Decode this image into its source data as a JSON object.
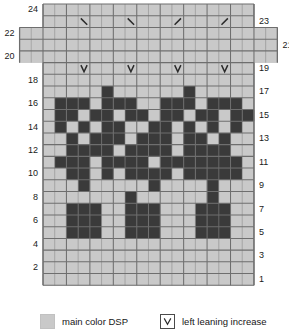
{
  "colors": {
    "main_color": "#c9c9c9",
    "contrast_color": "#3a3a3a",
    "grid_line": "#6e6e6e",
    "grid_line_minor": "#8a8a8a",
    "background": "#ffffff",
    "text": "#1a1a1a",
    "symbol": "#2b2b2b"
  },
  "chart_data": {
    "type": "heatmap",
    "title": "",
    "xlabel": "",
    "ylabel": "",
    "grid": true,
    "columns": 18,
    "rows": 24,
    "cell_px": 11.7,
    "legend_position": "bottom",
    "value_legend": {
      "0": "main color DSP",
      "1": "contrast color",
      "null": "no stitch"
    },
    "row_labels_left": [
      "24",
      "22",
      "20",
      "18",
      "16",
      "14",
      "12",
      "10",
      "8",
      "6",
      "4",
      "2"
    ],
    "row_labels_right": [
      "23",
      "21",
      "19",
      "17",
      "15",
      "13",
      "11",
      "9",
      "7",
      "5",
      "3",
      "1"
    ],
    "row_extension": {
      "note": "rows 20,21,22 extend 2 columns further at each side",
      "rows": [
        20,
        21,
        22
      ],
      "extra_left": 2,
      "extra_right": 2
    },
    "rows_data": [
      {
        "row": 24,
        "cells": [
          0,
          0,
          0,
          0,
          0,
          0,
          0,
          0,
          0,
          0,
          0,
          0,
          0,
          0,
          0,
          0,
          0,
          0
        ]
      },
      {
        "row": 23,
        "cells": [
          0,
          0,
          0,
          0,
          0,
          0,
          0,
          0,
          0,
          0,
          0,
          0,
          0,
          0,
          0,
          0,
          0,
          0
        ],
        "symbols": [
          {
            "col": 3,
            "type": "right-leaning-increase",
            "glyph": "\\"
          },
          {
            "col": 7,
            "type": "right-leaning-increase",
            "glyph": "\\"
          },
          {
            "col": 11,
            "type": "left-leaning-increase",
            "glyph": "/"
          },
          {
            "col": 15,
            "type": "left-leaning-increase",
            "glyph": "/"
          }
        ]
      },
      {
        "row": 22,
        "cells": [
          0,
          0,
          0,
          0,
          0,
          0,
          0,
          0,
          0,
          0,
          0,
          0,
          0,
          0,
          0,
          0,
          0,
          0
        ],
        "extended": true
      },
      {
        "row": 21,
        "cells": [
          0,
          0,
          0,
          0,
          0,
          0,
          0,
          0,
          0,
          0,
          0,
          0,
          0,
          0,
          0,
          0,
          0,
          0
        ],
        "extended": true
      },
      {
        "row": 20,
        "cells": [
          0,
          0,
          0,
          0,
          0,
          0,
          0,
          0,
          0,
          0,
          0,
          0,
          0,
          0,
          0,
          0,
          0,
          0
        ],
        "extended": true
      },
      {
        "row": 19,
        "cells": [
          0,
          0,
          0,
          0,
          0,
          0,
          0,
          0,
          0,
          0,
          0,
          0,
          0,
          0,
          0,
          0,
          0,
          0
        ],
        "symbols": [
          {
            "col": 3,
            "type": "left-leaning-increase",
            "glyph": "V"
          },
          {
            "col": 7,
            "type": "left-leaning-increase",
            "glyph": "V"
          },
          {
            "col": 11,
            "type": "left-leaning-increase",
            "glyph": "V"
          },
          {
            "col": 15,
            "type": "left-leaning-increase",
            "glyph": "V"
          }
        ]
      },
      {
        "row": 18,
        "cells": [
          0,
          0,
          0,
          0,
          0,
          0,
          0,
          0,
          0,
          0,
          0,
          0,
          0,
          0,
          0,
          0,
          0,
          0
        ]
      },
      {
        "row": 17,
        "cells": [
          0,
          0,
          0,
          0,
          0,
          1,
          0,
          0,
          0,
          0,
          0,
          0,
          1,
          0,
          0,
          0,
          0,
          0
        ]
      },
      {
        "row": 16,
        "cells": [
          0,
          1,
          1,
          1,
          0,
          1,
          1,
          1,
          0,
          0,
          1,
          1,
          1,
          0,
          1,
          1,
          1,
          0
        ]
      },
      {
        "row": 15,
        "cells": [
          0,
          1,
          1,
          0,
          1,
          1,
          0,
          1,
          1,
          0,
          1,
          1,
          0,
          1,
          1,
          0,
          1,
          1
        ]
      },
      {
        "row": 14,
        "cells": [
          0,
          1,
          0,
          1,
          0,
          1,
          1,
          0,
          0,
          1,
          1,
          0,
          1,
          0,
          1,
          0,
          1,
          0
        ]
      },
      {
        "row": 13,
        "cells": [
          0,
          0,
          1,
          0,
          1,
          1,
          1,
          0,
          1,
          1,
          1,
          0,
          1,
          1,
          0,
          1,
          0,
          0
        ]
      },
      {
        "row": 12,
        "cells": [
          0,
          0,
          1,
          1,
          1,
          1,
          0,
          1,
          1,
          1,
          1,
          0,
          1,
          1,
          1,
          1,
          0,
          0
        ]
      },
      {
        "row": 11,
        "cells": [
          0,
          1,
          1,
          1,
          0,
          1,
          1,
          1,
          1,
          0,
          1,
          1,
          1,
          1,
          1,
          1,
          1,
          0
        ]
      },
      {
        "row": 10,
        "cells": [
          0,
          0,
          1,
          1,
          0,
          1,
          0,
          1,
          1,
          1,
          1,
          0,
          1,
          1,
          1,
          1,
          1,
          0
        ]
      },
      {
        "row": 9,
        "cells": [
          0,
          0,
          0,
          1,
          0,
          0,
          0,
          0,
          0,
          1,
          0,
          0,
          0,
          0,
          1,
          0,
          0,
          0
        ]
      },
      {
        "row": 8,
        "cells": [
          0,
          0,
          0,
          0,
          0,
          0,
          0,
          1,
          0,
          0,
          0,
          0,
          0,
          0,
          1,
          0,
          0,
          0
        ]
      },
      {
        "row": 7,
        "cells": [
          0,
          0,
          1,
          1,
          1,
          0,
          0,
          1,
          1,
          1,
          0,
          0,
          0,
          1,
          1,
          1,
          0,
          0
        ]
      },
      {
        "row": 6,
        "cells": [
          0,
          0,
          1,
          1,
          1,
          0,
          0,
          1,
          1,
          1,
          0,
          0,
          0,
          1,
          1,
          1,
          0,
          0
        ]
      },
      {
        "row": 5,
        "cells": [
          0,
          0,
          1,
          1,
          1,
          0,
          0,
          1,
          1,
          1,
          0,
          0,
          0,
          1,
          1,
          1,
          0,
          0
        ]
      },
      {
        "row": 4,
        "cells": [
          0,
          0,
          0,
          0,
          0,
          0,
          0,
          0,
          0,
          0,
          0,
          0,
          0,
          0,
          0,
          0,
          0,
          0
        ]
      },
      {
        "row": 3,
        "cells": [
          0,
          0,
          0,
          0,
          0,
          0,
          0,
          0,
          0,
          0,
          0,
          0,
          0,
          0,
          0,
          0,
          0,
          0
        ]
      },
      {
        "row": 2,
        "cells": [
          0,
          0,
          0,
          0,
          0,
          0,
          0,
          0,
          0,
          0,
          0,
          0,
          0,
          0,
          0,
          0,
          0,
          0
        ]
      },
      {
        "row": 1,
        "cells": [
          0,
          0,
          0,
          0,
          0,
          0,
          0,
          0,
          0,
          0,
          0,
          0,
          0,
          0,
          0,
          0,
          0,
          0
        ]
      }
    ]
  },
  "legend": {
    "items": [
      {
        "kind": "swatch",
        "swatch_color": "#c9c9c9",
        "label": "main color DSP"
      },
      {
        "kind": "symbol",
        "glyph": "V",
        "label": "left leaning increase"
      }
    ]
  }
}
